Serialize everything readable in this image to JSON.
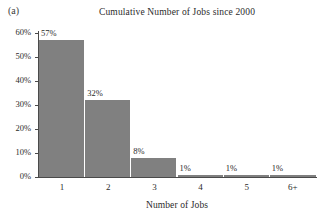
{
  "figure": {
    "panel_label": "(a)",
    "background_color": "#ffffff",
    "bar_color": "#808080",
    "axis_color": "#4a4a4a",
    "text_color": "#2b2b2b"
  },
  "chart_data": {
    "type": "bar",
    "title": "Cumulative Number of Jobs since 2000",
    "xlabel": "Number of Jobs",
    "ylabel": "",
    "categories": [
      "1",
      "2",
      "3",
      "4",
      "5",
      "6+"
    ],
    "values": [
      57,
      32,
      8,
      1,
      1,
      1
    ],
    "value_labels": [
      "57%",
      "32%",
      "8%",
      "1%",
      "1%",
      "1%"
    ],
    "ylim": [
      0,
      60
    ],
    "yticks": [
      0,
      10,
      20,
      30,
      40,
      50,
      60
    ],
    "ytick_labels": [
      "0%",
      "10%",
      "20%",
      "30%",
      "40%",
      "50%",
      "60%"
    ],
    "grid": false,
    "legend": false,
    "units": "percent"
  }
}
